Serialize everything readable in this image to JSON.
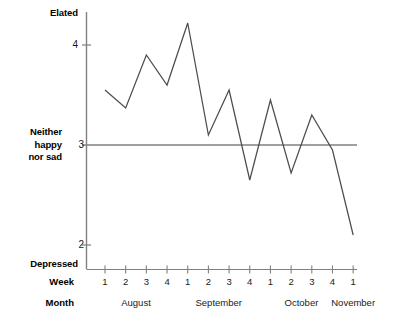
{
  "chart_data": {
    "type": "line",
    "title": "",
    "xlabel": "Week / Month",
    "ylabel": "Mood rating",
    "ylim": [
      1.55,
      4.55
    ],
    "yticks": [
      2,
      3,
      4
    ],
    "ytick_labels": [
      "2",
      "3",
      "4"
    ],
    "grid": false,
    "legend": "none",
    "y_axis_anchors": [
      {
        "label": "Elated",
        "position": "top"
      },
      {
        "label": "Neither happy nor sad",
        "position": "3"
      },
      {
        "label": "Depressed",
        "position": "bottom"
      }
    ],
    "reference_line": {
      "y": 3,
      "label": "Neither happy nor sad"
    },
    "x_axis": {
      "row_titles": [
        "Week",
        "Month"
      ],
      "week_labels": [
        "1",
        "2",
        "3",
        "4",
        "1",
        "2",
        "3",
        "4",
        "1",
        "2",
        "3",
        "4",
        "1"
      ],
      "month_groups": [
        {
          "name": "August",
          "weeks": 4
        },
        {
          "name": "September",
          "weeks": 4
        },
        {
          "name": "October",
          "weeks": 4
        },
        {
          "name": "November",
          "weeks": 1
        }
      ]
    },
    "categories": [
      "August 1",
      "August 2",
      "August 3",
      "August 4",
      "September 1",
      "September 2",
      "September 3",
      "September 4",
      "October 1",
      "October 2",
      "October 3",
      "October 4",
      "November 1"
    ],
    "values": [
      3.55,
      3.37,
      3.9,
      3.6,
      4.22,
      3.1,
      3.55,
      2.65,
      3.45,
      2.72,
      3.3,
      2.95,
      2.1
    ],
    "series": [
      {
        "name": "Mood",
        "values": [
          3.55,
          3.37,
          3.9,
          3.6,
          4.22,
          3.1,
          3.55,
          2.65,
          3.45,
          2.72,
          3.3,
          2.95,
          2.1
        ]
      }
    ]
  },
  "labels": {
    "elated": "Elated",
    "neutral": "Neither\nhappy\nnor sad",
    "neutral_line1": "Neither",
    "neutral_line2": "happy",
    "neutral_line3": "nor sad",
    "depressed": "Depressed",
    "week_row_title": "Week",
    "month_row_title": "Month",
    "ytick_4": "4",
    "ytick_3": "3",
    "ytick_2": "2"
  },
  "colors": {
    "line": "#4d4d4d",
    "axis": "#808080",
    "reference_line": "#808080",
    "text": "#000000",
    "background": "#ffffff"
  }
}
